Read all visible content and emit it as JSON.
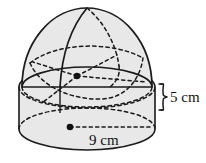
{
  "figure": {
    "shape_kind": "hemisphere-on-cylinder",
    "background_color": "#ffffff",
    "fill_color": "#e8e8e8",
    "outline_color": "#1a1a1a",
    "hidden_edge_style": "dotted",
    "labels": {
      "height": "5 cm",
      "diameter": "9 cm"
    },
    "markers": {
      "sphere_center": "center-dot",
      "base_center": "center-dot"
    },
    "annotations": {
      "height_brace": "right-curly-brace",
      "diameter_leader": "dotted-radius-line"
    }
  }
}
